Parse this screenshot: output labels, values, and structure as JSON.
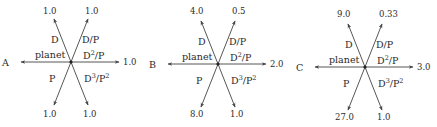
{
  "diagrams": [
    {
      "id": "A",
      "center": [
        71,
        62
      ],
      "letter": "A",
      "axes": {
        "planet_label": "planet",
        "D_label": "D",
        "DP_label": "D/P",
        "D2P_label_base": "D",
        "D2P_label_exp": "2",
        "D2P_label_tail": "/P",
        "D3P2_label_base": "D",
        "D3P2_label_exp1": "3",
        "D3P2_label_mid": "/P",
        "D3P2_label_exp2": "2",
        "P_label": "P"
      },
      "values": {
        "D": "1.0",
        "DP": "1.0",
        "D2P": "1.0",
        "D3P2": "1.0",
        "P": "1.0"
      }
    },
    {
      "id": "B",
      "center": [
        218,
        64
      ],
      "letter": "B",
      "axes": {
        "planet_label": "planet",
        "D_label": "D",
        "DP_label": "D/P",
        "D2P_label_base": "D",
        "D2P_label_exp": "2",
        "D2P_label_tail": "/P",
        "D3P2_label_base": "D",
        "D3P2_label_exp1": "3",
        "D3P2_label_mid": "/P",
        "D3P2_label_exp2": "2",
        "P_label": "P"
      },
      "values": {
        "D": "4.0",
        "DP": "0.5",
        "D2P": "2.0",
        "D3P2": "1.0",
        "P": "8.0"
      }
    },
    {
      "id": "C",
      "center": [
        365,
        67
      ],
      "letter": "C",
      "axes": {
        "planet_label": "planet",
        "D_label": "D",
        "DP_label": "D/P",
        "D2P_label_base": "D",
        "D2P_label_exp": "2",
        "D2P_label_tail": "/P",
        "D3P2_label_base": "D",
        "D3P2_label_exp1": "3",
        "D3P2_label_mid": "/P",
        "D3P2_label_exp2": "2",
        "P_label": "P"
      },
      "values": {
        "D": "9.0",
        "DP": "0.33",
        "D2P": "3.0",
        "D3P2": "1.0",
        "P": "27.0"
      }
    }
  ],
  "colors": {
    "line": "#444444",
    "text": "#2a2a2a",
    "background": "#ffffff"
  }
}
